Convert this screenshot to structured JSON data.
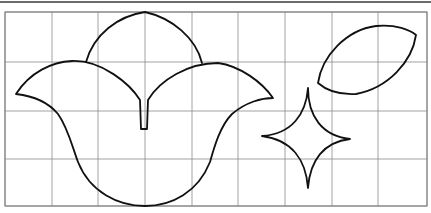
{
  "figure": {
    "colors": {
      "background": "#ffffff",
      "grid": "#8a8a8a",
      "stroke": "#111111",
      "top_rule": "#3a3a3a"
    },
    "grid": {
      "columns": 9,
      "rows": 4,
      "x_lines": [
        5,
        52,
        98,
        145,
        192,
        238,
        285,
        332,
        378,
        427
      ],
      "y_lines": [
        12,
        62,
        111,
        159,
        206
      ]
    },
    "shapes": [
      {
        "name": "tulip-top-petal",
        "label": "top petal"
      },
      {
        "name": "tulip-body",
        "label": "tulip flower"
      },
      {
        "name": "leaf-shape",
        "label": "leaf"
      },
      {
        "name": "four-point-star",
        "label": "concave star"
      }
    ]
  }
}
